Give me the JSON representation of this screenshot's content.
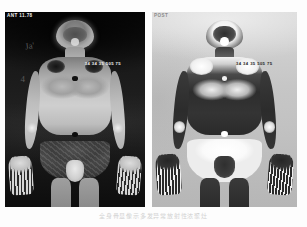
{
  "figure": {
    "kind": "medical-imaging-figure",
    "caption": "全身骨显像示多发异常放射性浓聚灶",
    "background_color": "#fdfdfd"
  },
  "panels": [
    {
      "id": "left",
      "name": "anterior-whole-body-scan-standard-contrast",
      "display_mode": "standard",
      "background_color": "#0a0a0a",
      "corner_annotation": "ANT 11.78",
      "mid_annotation": "34 34 35 505 75",
      "scribble_marks": [
        "Ja'",
        "4"
      ]
    },
    {
      "id": "right",
      "name": "anterior-whole-body-scan-inverted-contrast",
      "display_mode": "inverted",
      "background_color": "#c9c9c9",
      "corner_annotation": "POST",
      "mid_annotation": "34 34 35 505 75",
      "scribble_marks": []
    }
  ],
  "colors": {
    "panel_left_bg": "#0a0a0a",
    "panel_right_bg": "#c9c9c9",
    "page_bg": "#fdfdfd",
    "caption_color": "#d2d2d2"
  }
}
